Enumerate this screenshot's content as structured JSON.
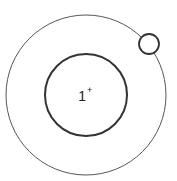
{
  "diagram": {
    "title": "",
    "nucleus": {
      "charge_number": "1",
      "charge_sign": "+"
    },
    "shells": 1,
    "electrons": 1,
    "colors": {
      "stroke": "#333333",
      "background": "#ffffff"
    }
  }
}
